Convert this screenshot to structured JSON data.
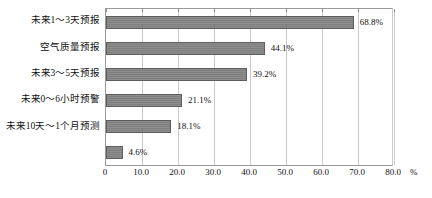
{
  "chart_data": {
    "type": "bar",
    "orientation": "horizontal",
    "title": "",
    "xlabel": "",
    "ylabel": "",
    "unit": "%",
    "xlim": [
      0,
      80
    ],
    "grid": true,
    "legend": "none",
    "categories": [
      "未来1～3天预报",
      "空气质量预报",
      "未来3～5天预报",
      "未来0～6小时预警",
      "未来10天～1个月预测",
      ""
    ],
    "values": [
      68.8,
      44.1,
      39.2,
      21.1,
      18.1,
      4.6
    ],
    "value_labels": [
      "68.8%",
      "44.1%",
      "39.2%",
      "21.1%",
      "18.1%",
      "4.6%"
    ],
    "xticks": [
      0,
      10,
      20,
      30,
      40,
      50,
      60,
      70,
      80
    ],
    "xtick_labels": [
      "0",
      "10.0",
      "20.0",
      "30.0",
      "40.0",
      "50.0",
      "60.0",
      "70.0",
      "80.0"
    ],
    "colors": {
      "bar_fill": "#848484",
      "bar_border": "#5d5d5d",
      "gridline": "#c9c9c9",
      "axis": "#9a9a9a",
      "text": "#111111",
      "background": "#ffffff"
    }
  }
}
